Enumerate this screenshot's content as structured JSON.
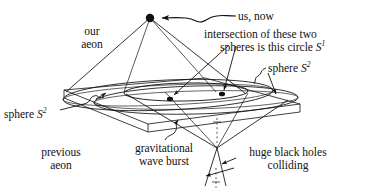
{
  "figure": {
    "background_color": "#ffffff",
    "ink_color": "#111111"
  },
  "labels": {
    "our_aeon": "our\naeon",
    "us_now": "us, now",
    "intersection_line1": "intersection of these two",
    "intersection_line2": "spheres is this circle ",
    "intersection_symbol": "S",
    "intersection_superscript": "1",
    "sphere_right_text": "sphere ",
    "sphere_right_symbol": "S",
    "sphere_right_superscript": "2",
    "sphere_left_text": "sphere ",
    "sphere_left_symbol": "S",
    "sphere_left_superscript": "2",
    "previous_aeon": "previous\naeon",
    "gravitational_wave_burst": "gravitational\nwave burst",
    "black_holes": "huge black holes\ncolliding"
  },
  "markers": {
    "observer_point": "us-now-dot",
    "intersection_point_left": "circle-intersection-front",
    "intersection_point_right": "circle-intersection-back"
  },
  "geometry": {
    "apex_x": 150,
    "apex_y": 18,
    "crossover_slab_top_y": 88,
    "crossover_slab_bottom_y": 126,
    "cone_vertex_x": 217,
    "cone_vertex_y": 148
  }
}
